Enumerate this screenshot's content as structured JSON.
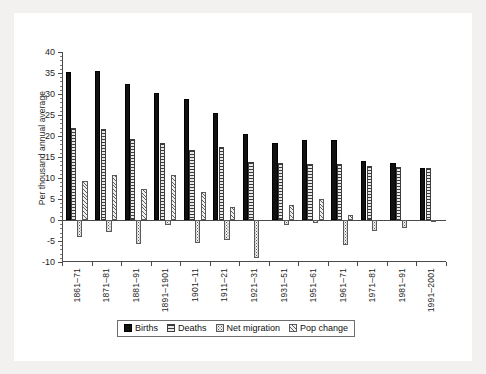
{
  "chart_data": {
    "type": "bar",
    "title": "",
    "subtitle": "",
    "xlabel": "",
    "ylabel": "Per thousand annual average",
    "ylim": [
      -10,
      40
    ],
    "ytick_step": 5,
    "grid": false,
    "legend_position": "bottom",
    "categories": [
      "1861–71",
      "1871–81",
      "1881–91",
      "1891–1901",
      "1901–11",
      "1911–21",
      "1921–31",
      "1931–51",
      "1951–61",
      "1961–71",
      "1971–81",
      "1981–91",
      "1991–2001"
    ],
    "yticks": [
      40,
      35,
      30,
      25,
      20,
      15,
      10,
      5,
      0,
      -5,
      -10
    ],
    "series": [
      {
        "name": "Births",
        "pattern": "solid-black",
        "values": [
          35.3,
          35.5,
          32.3,
          30.2,
          28.8,
          25.4,
          20.4,
          18.3,
          19.0,
          19.0,
          14.1,
          13.5,
          12.3
        ]
      },
      {
        "name": "Deaths",
        "pattern": "horizontal-lines",
        "values": [
          21.9,
          21.6,
          19.2,
          18.4,
          16.6,
          17.4,
          13.8,
          13.5,
          13.3,
          13.3,
          12.8,
          12.6,
          12.3
        ]
      },
      {
        "name": "Net migration",
        "pattern": "dotted",
        "values": [
          -4.1,
          -2.8,
          -5.7,
          -1.2,
          -5.5,
          -4.7,
          -9.1,
          -1.1,
          -0.7,
          -5.9,
          -2.5,
          -2.0,
          -0.5
        ]
      },
      {
        "name": "Pop change",
        "pattern": "diagonal-hatch",
        "values": [
          9.4,
          10.8,
          7.4,
          10.6,
          6.6,
          3.2,
          0.0,
          3.6,
          5.0,
          1.3,
          0.0,
          0.0,
          0.0
        ]
      }
    ]
  },
  "legend": {
    "items": [
      {
        "label": "Births"
      },
      {
        "label": "Deaths"
      },
      {
        "label": "Net migration"
      },
      {
        "label": "Pop change"
      }
    ]
  }
}
